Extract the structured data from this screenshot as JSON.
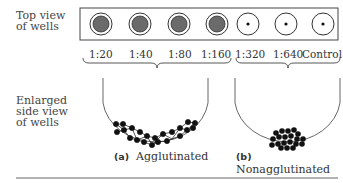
{
  "labels": {
    "top_view": [
      "Top view",
      "of wells"
    ],
    "side_view": [
      "Enlarged",
      "side view",
      "of wells"
    ]
  },
  "wells": [
    {
      "dilution": "1:20",
      "result": "agglutinated"
    },
    {
      "dilution": "1:40",
      "result": "agglutinated"
    },
    {
      "dilution": "1:80",
      "result": "agglutinated"
    },
    {
      "dilution": "1:160",
      "result": "agglutinated"
    },
    {
      "dilution": "1:320",
      "result": "nonagglutinated"
    },
    {
      "dilution": "1:640",
      "result": "nonagglutinated"
    },
    {
      "dilution": "Control",
      "result": "nonagglutinated"
    }
  ],
  "captions": {
    "a": {
      "letter": "(a)",
      "text": "Agglutinated"
    },
    "b": {
      "letter": "(b)",
      "text": "Nonagglutinated"
    }
  },
  "colors": {
    "fill": "#6b6b6b",
    "outline": "#333333",
    "cell": "#111111"
  }
}
